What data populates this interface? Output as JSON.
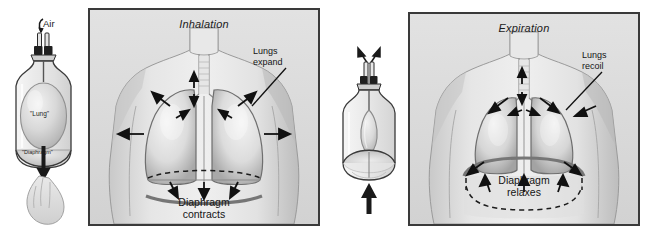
{
  "figure": {
    "background_color": "#ffffff",
    "panel_background_color": "#dcdcdc",
    "panel_border_color": "#3a3a3a",
    "ink_color": "#141414"
  },
  "inhalation": {
    "panel_title": "Inhalation",
    "model": {
      "air_label": "Air",
      "lung_label": "\"Lung\"",
      "diaphragm_label": "\"Diaphragm\"",
      "air_arrow": "curved-arrow-in",
      "diaphragm_arrow": "arrow-down",
      "hand_action": "hand-pulls-membrane-down"
    },
    "callout": {
      "line1": "Lungs",
      "line2": "expand"
    },
    "caption": {
      "line1": "Diaphragm",
      "line2": "contracts"
    },
    "arrow_directions": "outward-and-downward"
  },
  "expiration": {
    "panel_title": "Expiration",
    "model": {
      "air_arrow": "arrows-out-v",
      "diaphragm_arrow": "arrow-up",
      "hand_action": "membrane-released-up"
    },
    "callout": {
      "line1": "Lungs",
      "line2": "recoil"
    },
    "caption": {
      "line1": "Diaphragm",
      "line2": "relaxes"
    },
    "arrow_directions": "inward-and-upward"
  }
}
